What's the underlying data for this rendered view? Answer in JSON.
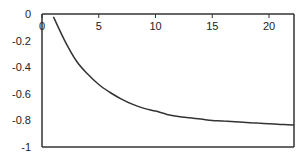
{
  "chart_data": {
    "type": "line",
    "title": "",
    "xlabel": "",
    "ylabel": "",
    "xlim": [
      0,
      22.2
    ],
    "ylim": [
      -1,
      0
    ],
    "grid": false,
    "legend": null,
    "x_ticks": [
      0,
      5,
      10,
      15,
      20
    ],
    "y_ticks": [
      0,
      -0.2,
      -0.4,
      -0.6,
      -0.8,
      -1
    ],
    "x_tick_labels": [
      "0",
      "5",
      "10",
      "15",
      "20"
    ],
    "y_tick_labels": [
      "0",
      "-0.2",
      "-0.4",
      "-0.6",
      "-0.8",
      "-1"
    ],
    "x_axis_position": "top",
    "series": [
      {
        "name": "series1",
        "color": "#333333",
        "x": [
          1,
          2,
          3,
          4,
          5,
          6,
          7,
          8,
          9,
          10,
          11,
          12,
          13,
          14,
          15,
          16,
          17,
          18,
          19,
          20,
          21,
          22.2
        ],
        "y": [
          -0.02,
          -0.2,
          -0.35,
          -0.45,
          -0.53,
          -0.59,
          -0.64,
          -0.68,
          -0.71,
          -0.73,
          -0.755,
          -0.77,
          -0.78,
          -0.79,
          -0.8,
          -0.805,
          -0.81,
          -0.815,
          -0.82,
          -0.825,
          -0.83,
          -0.835
        ]
      }
    ]
  }
}
